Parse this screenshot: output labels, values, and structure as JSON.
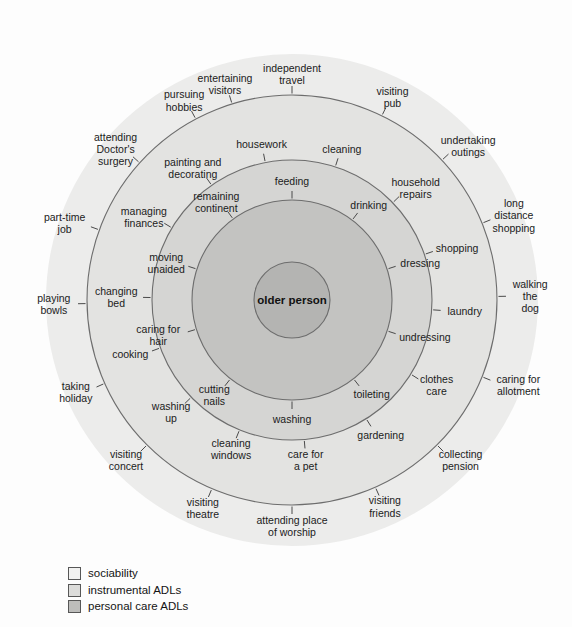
{
  "diagram": {
    "center": {
      "label": "older person"
    },
    "geometry": {
      "cx": 292,
      "cy": 300,
      "r_center": 38,
      "r_personal": 100,
      "r_instrumental": 140,
      "r_sociability": 205,
      "r_backdrop": 246
    },
    "colors": {
      "backdrop": "#ececeb",
      "sociability_fill": "#e3e3e1",
      "instrumental_fill": "#d5d5d3",
      "personal_fill": "#c3c3c1",
      "center_fill": "#b4b4b2",
      "stroke": "#6d6d6d",
      "text": "#1b1b1b"
    },
    "rings": [
      {
        "name": "personal care ADLs",
        "key": "personal",
        "labels": [
          {
            "text": "feeding",
            "angle": -90
          },
          {
            "text": "drinking",
            "angle": -53
          },
          {
            "text": "dressing",
            "angle": -18
          },
          {
            "text": "undressing",
            "angle": 18
          },
          {
            "text": "toileting",
            "angle": 52
          },
          {
            "text": "washing",
            "angle": 90
          },
          {
            "text": "cutting nails",
            "angle": 128
          },
          {
            "text": "caring for hair",
            "angle": 163
          },
          {
            "text": "moving unaided",
            "angle": -162
          },
          {
            "text": "remaining continent",
            "angle": -126
          }
        ]
      },
      {
        "name": "instrumental ADLs",
        "key": "instrumental",
        "labels": [
          {
            "text": "housework",
            "angle": -101
          },
          {
            "text": "cleaning",
            "angle": -72
          },
          {
            "text": "household repairs",
            "angle": -44
          },
          {
            "text": "shopping",
            "angle": -19
          },
          {
            "text": "laundry",
            "angle": 4
          },
          {
            "text": "clothes care",
            "angle": 32
          },
          {
            "text": "gardening",
            "angle": 58
          },
          {
            "text": "care for a pet",
            "angle": 85
          },
          {
            "text": "cleaning windows",
            "angle": 112
          },
          {
            "text": "washing up",
            "angle": 136
          },
          {
            "text": "cooking",
            "angle": 160
          },
          {
            "text": "changing bed",
            "angle": -179
          },
          {
            "text": "managing finances",
            "angle": -149
          },
          {
            "text": "painting and decorating",
            "angle": -125
          }
        ]
      },
      {
        "name": "sociability",
        "key": "sociability",
        "labels": [
          {
            "text": "independent travel",
            "angle": -90
          },
          {
            "text": "visiting pub",
            "angle": -64
          },
          {
            "text": "undertaking outings",
            "angle": -43
          },
          {
            "text": "long distance shopping",
            "angle": -22
          },
          {
            "text": "walking the dog",
            "angle": -1
          },
          {
            "text": "caring for allotment",
            "angle": 22
          },
          {
            "text": "collecting pension",
            "angle": 45
          },
          {
            "text": "visiting friends",
            "angle": 66
          },
          {
            "text": "attending place of worship",
            "angle": 90
          },
          {
            "text": "visiting theatre",
            "angle": 113
          },
          {
            "text": "visiting concert",
            "angle": 135
          },
          {
            "text": "taking holiday",
            "angle": 156
          },
          {
            "text": "playing bowls",
            "angle": 179
          },
          {
            "text": "part-time job",
            "angle": -160
          },
          {
            "text": "attending Doctor's surgery",
            "angle": -138
          },
          {
            "text": "pursuing hobbies",
            "angle": -118
          },
          {
            "text": "entertaining visitors",
            "angle": -107
          }
        ]
      }
    ]
  },
  "legend": {
    "items": [
      {
        "label": "sociability",
        "color": "#f1f1f0"
      },
      {
        "label": "instrumental ADLs",
        "color": "#dcdcda"
      },
      {
        "label": "personal care ADLs",
        "color": "#bdbdbb"
      }
    ]
  }
}
